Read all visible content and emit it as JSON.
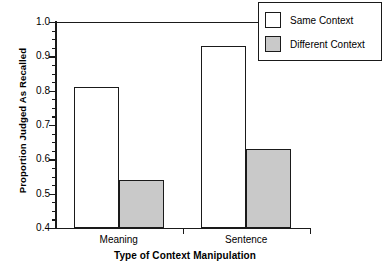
{
  "chart_data": {
    "type": "bar",
    "title": "",
    "xlabel": "Type of Context Manipulation",
    "ylabel": "Proportion Judged As Recalled",
    "categories": [
      "Meaning",
      "Sentence"
    ],
    "series": [
      {
        "name": "Same Context",
        "values": [
          0.81,
          0.93
        ],
        "color": "#ffffff"
      },
      {
        "name": "Different Context",
        "values": [
          0.54,
          0.63
        ],
        "color": "#c9c9c9"
      }
    ],
    "ylim": [
      0.4,
      1.0
    ],
    "yticks": [
      0.4,
      0.5,
      0.6,
      0.7,
      0.8,
      0.9,
      1.0
    ],
    "ytick_labels": [
      "0.4",
      "0.5",
      "0.6",
      "0.7",
      "0.8",
      "0.9",
      "1.0"
    ],
    "yminor_step": 0.025,
    "grid": false,
    "legend_position": "top-right",
    "legend_entries": [
      "Same Context",
      "Different Context"
    ]
  },
  "axis": {
    "y_title": "Proportion Judged As Recalled",
    "x_title": "Type of Context Manipulation"
  },
  "legend": {
    "items": [
      {
        "label": "Same Context",
        "swatch": "white-square-swatch"
      },
      {
        "label": "Different Context",
        "swatch": "gray-square-swatch"
      }
    ]
  }
}
